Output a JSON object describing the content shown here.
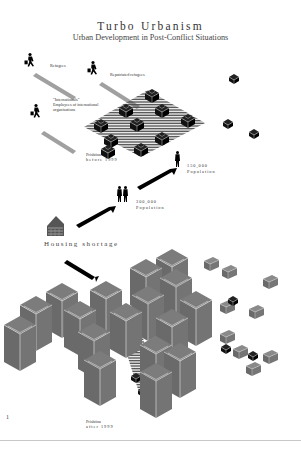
{
  "header": {
    "title": "Turbo Urbanism",
    "subtitle": "Urban Development in Post-Conflict Situations"
  },
  "labels": {
    "refugees": "Refugees",
    "repatriated": "Repatriated refugees",
    "internationals_line1": "\"Internationals\"",
    "internationals_line2": "Employees of international",
    "internationals_line3": "organisations",
    "before_line1": "Prishtina",
    "before_line2": "before 1999",
    "pop150_line1": "150,000",
    "pop150_line2": "Population",
    "pop300_line1": "300,000",
    "pop300_line2": "Population",
    "housing": "Housing shortage",
    "after_line1": "Prishtina",
    "after_line2": "after 1999"
  },
  "page_number": "1",
  "icons": {
    "walker": "person-with-suitcase-icon",
    "person": "person-silhouette-icon",
    "house": "house-icon",
    "block": "building-block-icon"
  },
  "colors": {
    "background": "#ffffff",
    "black_blocks": "#111111",
    "grey_blocks": "#6e6e6e",
    "grey_block_top": "#7a7a7a",
    "arrow_grey": "#9a9a9a",
    "hatch": "#555555"
  }
}
